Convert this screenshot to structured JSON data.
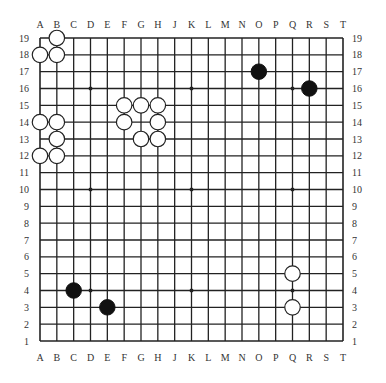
{
  "board": {
    "size": 19,
    "columns": [
      "A",
      "B",
      "C",
      "D",
      "E",
      "F",
      "G",
      "H",
      "J",
      "K",
      "L",
      "M",
      "N",
      "O",
      "P",
      "Q",
      "R",
      "S",
      "T"
    ],
    "rows": [
      "19",
      "18",
      "17",
      "16",
      "15",
      "14",
      "13",
      "12",
      "11",
      "10",
      "9",
      "8",
      "7",
      "6",
      "5",
      "4",
      "3",
      "2",
      "1"
    ],
    "star_points": [
      "D16",
      "K16",
      "Q16",
      "D10",
      "K10",
      "Q10",
      "D4",
      "K4",
      "Q4"
    ],
    "colors": {
      "line": "#222222",
      "black_stone": "#111111",
      "white_stone": "#ffffff",
      "stone_outline": "#222222",
      "label": "#333333"
    }
  },
  "stones": {
    "black": [
      "O17",
      "R16",
      "C4",
      "E3"
    ],
    "white": [
      "B19",
      "A18",
      "B18",
      "F15",
      "G15",
      "H15",
      "F14",
      "H14",
      "G13",
      "H13",
      "A14",
      "B14",
      "B13",
      "A12",
      "B12",
      "Q5",
      "Q3"
    ]
  }
}
